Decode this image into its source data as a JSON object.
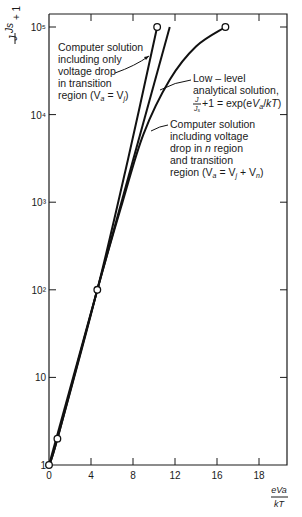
{
  "chart_data": {
    "type": "line",
    "title": "",
    "xlabel": "eVa/kT",
    "ylabel": "J/Js + 1",
    "yscale": "log",
    "xlim": [
      0,
      22.7
    ],
    "ylim": [
      1,
      100000
    ],
    "x_ticks": [
      {
        "value": 0,
        "label": "0"
      },
      {
        "value": 4,
        "label": "4"
      },
      {
        "value": 8,
        "label": "8"
      },
      {
        "value": 12,
        "label": "12"
      },
      {
        "value": 16,
        "label": "16"
      },
      {
        "value": 20,
        "label": "18"
      }
    ],
    "y_ticks": [
      {
        "value": 1,
        "label": "1"
      },
      {
        "value": 10,
        "label": "10"
      },
      {
        "value": 100,
        "label": "10²"
      },
      {
        "value": 1000,
        "label": "10³"
      },
      {
        "value": 10000,
        "label": "10⁴"
      },
      {
        "value": 100000,
        "label": "10⁵"
      }
    ],
    "grid": false,
    "series": [
      {
        "name": "Computer solution including only voltage drop in transition region (Va = Vj)",
        "points": [
          [
            0,
            1
          ],
          [
            0.8,
            2
          ],
          [
            4.6,
            100
          ],
          [
            7.5,
            3000
          ],
          [
            10.3,
            100000
          ]
        ],
        "markers": [
          [
            0,
            1
          ],
          [
            0.8,
            2
          ],
          [
            4.6,
            100
          ],
          [
            10.3,
            100000
          ]
        ]
      },
      {
        "name": "Low-level analytical solution, J/Js + 1 = exp(eVa/kT)",
        "points": [
          [
            0,
            1
          ],
          [
            11.5,
            100000
          ]
        ],
        "markers": []
      },
      {
        "name": "Computer solution including voltage drop in n region and transition region (Va = Vj + Vn)",
        "points": [
          [
            0,
            1
          ],
          [
            0.8,
            2
          ],
          [
            4.6,
            100
          ],
          [
            7.0,
            1000
          ],
          [
            9.0,
            6000
          ],
          [
            11.5,
            25000
          ],
          [
            14.0,
            60000
          ],
          [
            16.8,
            100000
          ]
        ],
        "markers": [
          [
            0,
            1
          ],
          [
            0.8,
            2
          ],
          [
            4.6,
            100
          ],
          [
            16.8,
            100000
          ]
        ]
      }
    ],
    "annotations": [
      {
        "lines": [
          "Computer solution",
          "including only",
          "voltage drop",
          "in transition",
          "region (Va = Vj)"
        ],
        "points_to": "series 0"
      },
      {
        "lines": [
          "Low – level",
          "analytical solution,",
          "J/Js +1 = exp(eVa/kT)"
        ],
        "points_to": "series 1"
      },
      {
        "lines": [
          "Computer solution",
          "including voltage",
          "drop in n region",
          "and transition",
          "region (Va = Vj + Vn)"
        ],
        "points_to": "series 2"
      }
    ]
  },
  "labels": {
    "y_axis_top": "J",
    "y_axis_bottom": "Js",
    "y_axis_plus": "+ 1",
    "x_axis_top": "eVa",
    "x_axis_bottom": "kT",
    "ann1": [
      "Computer solution",
      "including only",
      "voltage drop",
      "in transition",
      "region (V",
      "a",
      " = V",
      "j",
      ")"
    ],
    "ann2": [
      "Low – level",
      "analytical solution,"
    ],
    "ann3": [
      "Computer solution",
      "including voltage",
      "drop in ",
      "n",
      " region",
      "and transition",
      "region (V",
      "a",
      " = V",
      "j",
      " + V",
      "n",
      ")"
    ]
  }
}
